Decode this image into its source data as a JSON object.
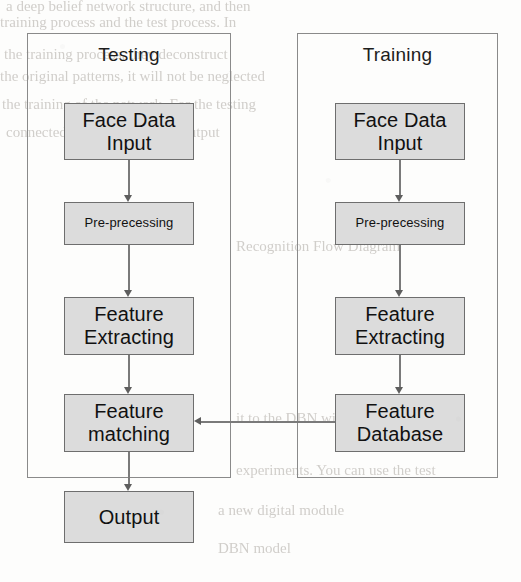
{
  "figure": {
    "type": "flowchart",
    "colors": {
      "node_fill": "#dcdcdc",
      "node_border": "#6e6e6e",
      "container_border": "#8a8a8a",
      "connector": "#7a7a7a",
      "text": "#111111",
      "page_background": "#fdfdfc"
    }
  },
  "groups": [
    {
      "id": "testing",
      "title": "Testing"
    },
    {
      "id": "training",
      "title": "Training"
    }
  ],
  "nodes": {
    "testing": [
      {
        "id": "test-face-data-input",
        "label": "Face Data\nInput",
        "size": "big"
      },
      {
        "id": "test-pre-precessing",
        "label": "Pre-precessing",
        "size": "small"
      },
      {
        "id": "test-feature-extracting",
        "label": "Feature\nExtracting",
        "size": "big"
      },
      {
        "id": "test-feature-matching",
        "label": "Feature\nmatching",
        "size": "big"
      }
    ],
    "training": [
      {
        "id": "train-face-data-input",
        "label": "Face Data\nInput",
        "size": "big"
      },
      {
        "id": "train-pre-precessing",
        "label": "Pre-precessing",
        "size": "small"
      },
      {
        "id": "train-feature-extracting",
        "label": "Feature\nExtracting",
        "size": "big"
      },
      {
        "id": "train-feature-database",
        "label": "Feature\nDatabase",
        "size": "big"
      }
    ],
    "output": {
      "id": "output",
      "label": "Output",
      "size": "big"
    }
  },
  "labels": {
    "testing_title": "Testing",
    "training_title": "Training",
    "test_face_data_input": "Face Data\nInput",
    "test_pre_precessing": "Pre-precessing",
    "test_feature_extracting": "Feature\nExtracting",
    "test_feature_matching": "Feature\nmatching",
    "train_face_data_input": "Face Data\nInput",
    "train_pre_precessing": "Pre-precessing",
    "train_feature_extracting": "Feature\nExtracting",
    "train_feature_database": "Feature\nDatabase",
    "output": "Output"
  },
  "connections": [
    {
      "from": "test-face-data-input",
      "to": "test-pre-precessing",
      "direction": "down"
    },
    {
      "from": "test-pre-precessing",
      "to": "test-feature-extracting",
      "direction": "down"
    },
    {
      "from": "test-feature-extracting",
      "to": "test-feature-matching",
      "direction": "down"
    },
    {
      "from": "test-feature-matching",
      "to": "output",
      "direction": "down"
    },
    {
      "from": "train-face-data-input",
      "to": "train-pre-precessing",
      "direction": "down"
    },
    {
      "from": "train-pre-precessing",
      "to": "train-feature-extracting",
      "direction": "down"
    },
    {
      "from": "train-feature-extracting",
      "to": "train-feature-database",
      "direction": "down"
    },
    {
      "from": "train-feature-database",
      "to": "test-feature-matching",
      "direction": "left"
    }
  ],
  "background_text": {
    "top_lines": [
      "a deep belief network structure, and then",
      "training process and the test process. In",
      "the training process, they deconstruct",
      "the original patterns, it will not be neglected",
      "the training of the network. For the testing",
      "connected to the classifier to output"
    ],
    "mid_line": "Recognition Flow Diagram",
    "lower_lines": [
      "it to the DBN with the existing",
      "experiments. You can use the test",
      "a new digital module",
      "DBN model"
    ]
  }
}
